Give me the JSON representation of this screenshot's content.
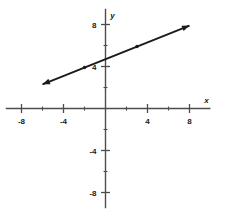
{
  "chart_data": {
    "type": "line",
    "title": "",
    "subtitle": "",
    "xlabel": "x",
    "ylabel": "y",
    "xlim": [
      -9.5,
      10.0
    ],
    "ylim": [
      -9.5,
      9.5
    ],
    "grid": false,
    "legend_position": "none",
    "axis_color": "#4d4d4d",
    "line_color": "#1a1a1a",
    "point_color": "#1a1a1a",
    "background_color": "#ffffff",
    "x_major_ticks": [
      -8,
      -4,
      4,
      8
    ],
    "x_major_tick_labels": [
      "-8",
      "-4",
      "4",
      "8"
    ],
    "x_minor_ticks": [
      -6,
      -2,
      2,
      6
    ],
    "y_major_ticks": [
      8,
      4,
      -4,
      -8
    ],
    "y_major_tick_labels": [
      "8",
      "4",
      "-4",
      "-8"
    ],
    "y_minor_ticks": [
      6,
      2,
      -2,
      -6
    ],
    "origin_label": "",
    "series": [
      {
        "name": "line",
        "equation": "y = 0.4x + 4.7",
        "slope": 0.4,
        "intercept": 4.7,
        "arrow_start": true,
        "arrow_end": true,
        "endpoints": [
          {
            "x": -6.0,
            "y": 2.3
          },
          {
            "x": 8.0,
            "y": 7.9
          }
        ],
        "marked_points": [
          {
            "x": -2.0,
            "y": 3.9
          },
          {
            "x": 3.0,
            "y": 5.9
          }
        ]
      }
    ],
    "annotations": []
  },
  "axis_labels": {
    "x": "x",
    "y": "y"
  }
}
